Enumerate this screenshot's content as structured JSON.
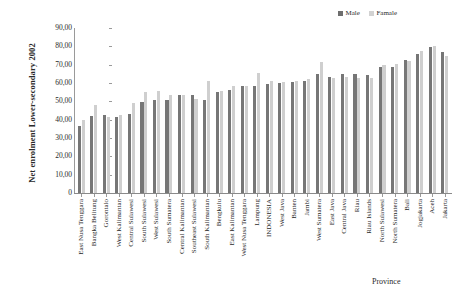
{
  "chart_data": {
    "type": "bar",
    "title": "",
    "ylabel": "Net enrolment Lower-secondary 2002",
    "xlabel": "Province",
    "ylim": [
      0,
      90
    ],
    "ytick_labels": [
      "90,00",
      "80,00",
      "70,00",
      "60,00",
      "50,00",
      "40,00",
      "30,00",
      "20,00",
      "10,00",
      "0"
    ],
    "ytick_values": [
      90,
      80,
      70,
      60,
      50,
      40,
      30,
      20,
      10,
      0
    ],
    "grid": false,
    "legend_position": "top-right",
    "categories": [
      "East Nusa Tenggara",
      "Bangka Belitung",
      "Gorontalo",
      "West Kalimantan",
      "Central Sulawesi",
      "South Sulawesi",
      "West Sulawesi",
      "South Sumatera",
      "Central Kalimantan",
      "Southeast Sulawesi",
      "South Kalimantan",
      "Bengkulu",
      "East Kalimantan",
      "West Nusa Tenggara",
      "Lampung",
      "INDONESIA",
      "West Java",
      "Banten",
      "Jambi",
      "West Sumatera",
      "East Java",
      "Central Java",
      "Riau",
      "Riau Islands",
      "North Sulawesi",
      "North Sumatera",
      "Bali",
      "Jogjakarta",
      "Aceh",
      "Jakarta"
    ],
    "series": [
      {
        "name": "Male",
        "color": "#767676",
        "values": [
          36.5,
          42.0,
          42.5,
          41.5,
          43.0,
          49.5,
          51.0,
          51.0,
          53.5,
          53.5,
          51.0,
          55.0,
          56.0,
          58.5,
          58.5,
          59.5,
          60.0,
          60.5,
          61.0,
          65.0,
          63.5,
          65.0,
          65.0,
          64.5,
          68.5,
          69.0,
          72.5,
          76.0,
          79.5,
          77.0
        ]
      },
      {
        "name": "Famale",
        "color": "#cfcfcf",
        "values": [
          40.0,
          48.0,
          41.5,
          42.5,
          49.0,
          55.0,
          55.5,
          53.5,
          53.5,
          51.5,
          61.0,
          55.5,
          58.5,
          58.5,
          65.5,
          61.0,
          60.5,
          61.0,
          62.0,
          71.5,
          63.0,
          63.5,
          62.5,
          63.0,
          70.0,
          70.5,
          72.0,
          77.5,
          80.0,
          75.0
        ]
      }
    ]
  },
  "legend": {
    "entries": [
      {
        "label": "Male",
        "swatch_class": "swatch-male"
      },
      {
        "label": "Famale",
        "swatch_class": "swatch-female"
      }
    ]
  },
  "axes": {
    "y_title": "Net enrolment Lower-secondary 2002",
    "x_title": "Province"
  }
}
